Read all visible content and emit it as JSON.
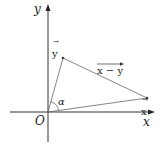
{
  "diagram": {
    "axes": {
      "x_label": "x",
      "y_label": "y",
      "origin_label": "O"
    },
    "vectors": {
      "x": {
        "label": "x",
        "arrow": "→",
        "from": [
          48,
          112
        ],
        "to": [
          147,
          98
        ]
      },
      "y": {
        "label": "y",
        "arrow": "→",
        "from": [
          48,
          112
        ],
        "to": [
          63,
          58
        ]
      },
      "difference": {
        "label": "x − y",
        "from": [
          63,
          58
        ],
        "to": [
          147,
          98
        ]
      }
    },
    "angle_label": "α",
    "colors": {
      "stroke": "#333333",
      "thin": "#666666"
    }
  }
}
